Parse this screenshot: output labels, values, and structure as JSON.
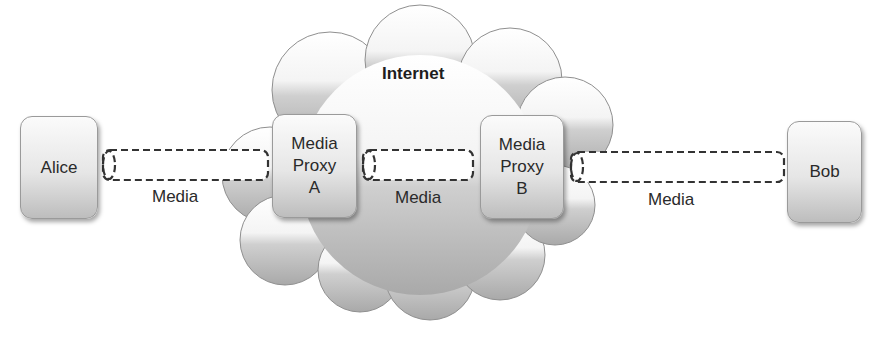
{
  "diagram": {
    "cloud_label": "Internet",
    "nodes": {
      "alice": "Alice",
      "bob": "Bob",
      "proxy_a": [
        "Media",
        "Proxy",
        "A"
      ],
      "proxy_b": [
        "Media",
        "Proxy",
        "B"
      ]
    },
    "links": [
      {
        "from": "Alice",
        "to": "Media Proxy A",
        "label": "Media"
      },
      {
        "from": "Media Proxy A",
        "to": "Media Proxy B",
        "label": "Media"
      },
      {
        "from": "Media Proxy B",
        "to": "Bob",
        "label": "Media"
      }
    ]
  }
}
